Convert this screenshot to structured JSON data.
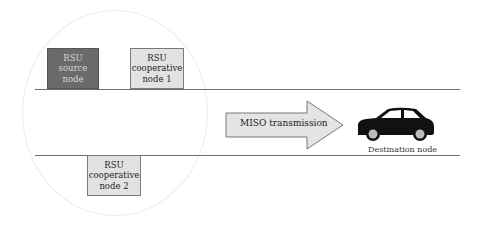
{
  "diagram": {
    "title": "",
    "nodes": {
      "source": {
        "label": "RSU\nsource\nnode",
        "fill": "#6a6a6a"
      },
      "coop1": {
        "label": "RSU\ncooperative\nnode 1",
        "fill": "#e2e2e2"
      },
      "coop2": {
        "label": "RSU\ncooperative\nnode 2",
        "fill": "#e2e2e2"
      }
    },
    "arrow": {
      "label": "MISO transmission",
      "fill": "#e4e4e4"
    },
    "destination": {
      "label": "Destination node",
      "icon": "car-icon"
    },
    "coverage": {
      "shape": "circle",
      "stroke": "#ececec"
    },
    "road": {
      "line_color": "#6d6d6d"
    }
  }
}
